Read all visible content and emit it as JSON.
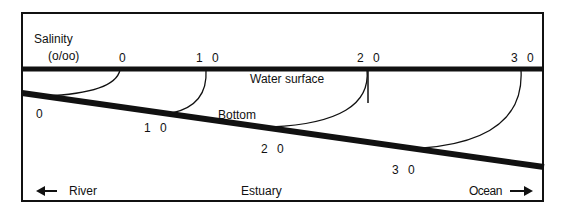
{
  "title": {
    "line1": "Salinity",
    "line2": "(o/oo)"
  },
  "surface_salinity_labels": [
    "0",
    "1 0",
    "2 0",
    "3 0"
  ],
  "bottom_salinity_labels": [
    "0",
    "1 0",
    "2 0",
    "3 0"
  ],
  "water_surface_label": "Water surface",
  "bottom_label": "Bottom",
  "footer": {
    "river_label": "River",
    "estuary_label": "Estuary",
    "ocean_label": "Ocean"
  },
  "colors": {
    "ink": "#111111",
    "background": "#ffffff"
  }
}
